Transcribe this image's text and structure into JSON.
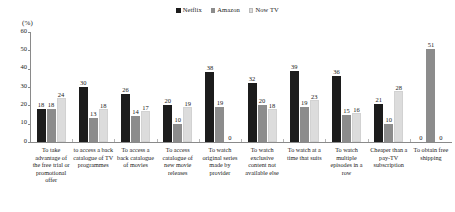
{
  "chart_data": {
    "type": "bar",
    "title": "",
    "subtitle": "",
    "xlabel": "",
    "ylabel": "(%)",
    "ylim": [
      0,
      60
    ],
    "yticks": [
      0,
      10,
      20,
      30,
      40,
      50,
      60
    ],
    "grid": false,
    "legend_position": "top-center",
    "categories": [
      "To take advantage of the free trial or promotional offer",
      "to access a back catalogue of TV programmes",
      "To access a back catalogue of movies",
      "To access catalogue of new movie releases",
      "To watch original series made by provider",
      "To watch exclusive content not available else",
      "To watch at a time that suits",
      "To watch multiple episodes in a row",
      "Cheaper than a pay-TV subscription",
      "To obtain free shipping"
    ],
    "series": [
      {
        "name": "Netflix",
        "color": "#1c1c1c",
        "values": [
          18,
          30,
          26,
          20,
          38,
          32,
          39,
          36,
          21,
          0
        ]
      },
      {
        "name": "Amazon",
        "color": "#8c8c8c",
        "values": [
          18,
          13,
          14,
          10,
          19,
          20,
          19,
          15,
          10,
          51
        ]
      },
      {
        "name": "Now TV",
        "color": "#dcdcdc",
        "values": [
          24,
          18,
          17,
          19,
          0,
          18,
          23,
          16,
          28,
          0
        ]
      }
    ]
  }
}
